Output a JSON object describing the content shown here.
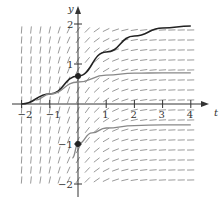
{
  "chart_data": {
    "type": "line",
    "title": "",
    "subtitle": "Slope field with solution curves",
    "xlabel": "t",
    "ylabel": "y",
    "xlim": [
      -2,
      4
    ],
    "ylim": [
      -2,
      2
    ],
    "x_ticks": [
      "-2",
      "-1",
      "1",
      "2",
      "3",
      "4"
    ],
    "y_ticks": [
      "2",
      "1",
      "-1",
      "-2"
    ],
    "grid": false,
    "legend": null,
    "slope_field": {
      "t_range": [
        -2,
        4
      ],
      "y_range": [
        -2,
        2
      ],
      "description": "steep near t<0, nearly horizontal for t>2"
    },
    "series": [
      {
        "name": "solution-through-(0,0.7)",
        "color": "#222222",
        "marked_point": [
          0,
          0.7
        ],
        "x": [
          -2,
          -1,
          0,
          1,
          2,
          3,
          4
        ],
        "y": [
          0.0,
          0.25,
          0.7,
          1.3,
          1.7,
          1.9,
          1.95
        ]
      },
      {
        "name": "solution-upper-gray",
        "color": "#888888",
        "x": [
          -1.5,
          -1,
          0,
          1,
          2,
          3,
          4
        ],
        "y": [
          0.1,
          0.25,
          0.55,
          0.72,
          0.77,
          0.78,
          0.78
        ]
      },
      {
        "name": "solution-through-(0,-1)",
        "color": "#888888",
        "marked_point": [
          0,
          -1
        ],
        "x": [
          -0.2,
          0,
          0.5,
          1,
          2,
          3,
          4
        ],
        "y": [
          -1.35,
          -1.0,
          -0.72,
          -0.6,
          -0.54,
          -0.52,
          -0.52
        ]
      }
    ]
  }
}
